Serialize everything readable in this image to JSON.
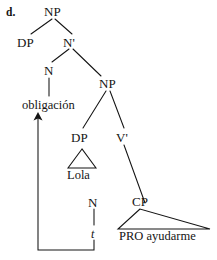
{
  "figure": {
    "example_label": "d.",
    "nodes": {
      "np_root": "NP",
      "dp_spec": "DP",
      "nbar": "N'",
      "n_head": "N",
      "np_lower": "NP",
      "dp_lola": "DP",
      "vbar": "V'",
      "cp": "CP",
      "n_trace_head": "N"
    },
    "terminals": {
      "obligacion": "obligación",
      "lola": "Lola",
      "pro_ayudarme": "PRO ayudarme",
      "trace": "t"
    },
    "annotations": {
      "movement_arrow": "movement-arrow"
    },
    "colors": {
      "ink": "#141414",
      "background": "#ffffff"
    }
  }
}
